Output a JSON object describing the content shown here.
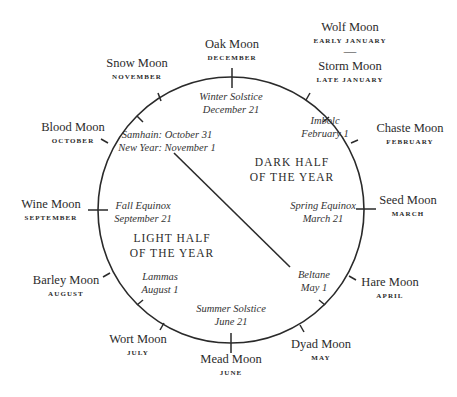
{
  "colors": {
    "ink": "#2a2a2a",
    "background": "#ffffff"
  },
  "geometry": {
    "cx": 231,
    "cy": 210,
    "r": 133
  },
  "divider": {
    "x1": 174,
    "y1": 153,
    "x2": 290,
    "y2": 267
  },
  "halves": {
    "dark": {
      "line1": "DARK HALF",
      "line2": "OF THE YEAR",
      "x": 292,
      "y": 166
    },
    "light": {
      "line1": "LIGHT HALF",
      "line2": "OF THE YEAR",
      "x": 172,
      "y": 242
    }
  },
  "moons": [
    {
      "name": "Oak Moon",
      "month": "DECEMBER",
      "x": 232,
      "y": 48
    },
    {
      "name": "Wolf Moon",
      "month": "EARLY JANUARY",
      "x": 350,
      "y": 31,
      "separator": "—"
    },
    {
      "name": "Storm Moon",
      "month": "LATE JANUARY",
      "x": 350,
      "y": 70
    },
    {
      "name": "Chaste Moon",
      "month": "FEBRUARY",
      "x": 410,
      "y": 132
    },
    {
      "name": "Seed Moon",
      "month": "MARCH",
      "x": 408,
      "y": 204
    },
    {
      "name": "Hare Moon",
      "month": "APRIL",
      "x": 390,
      "y": 286
    },
    {
      "name": "Dyad Moon",
      "month": "MAY",
      "x": 321,
      "y": 348
    },
    {
      "name": "Mead Moon",
      "month": "JUNE",
      "x": 231,
      "y": 363
    },
    {
      "name": "Wort Moon",
      "month": "JULY",
      "x": 138,
      "y": 343
    },
    {
      "name": "Barley Moon",
      "month": "AUGUST",
      "x": 66,
      "y": 284
    },
    {
      "name": "Wine Moon",
      "month": "SEPTEMBER",
      "x": 51,
      "y": 208
    },
    {
      "name": "Blood Moon",
      "month": "OCTOBER",
      "x": 73,
      "y": 131
    },
    {
      "name": "Snow Moon",
      "month": "NOVEMBER",
      "x": 137,
      "y": 67
    }
  ],
  "festivals": [
    {
      "line1": "Winter Solstice",
      "line2": "December 21",
      "x": 231,
      "y": 100
    },
    {
      "line1": "Imbolc",
      "line2": "February 1",
      "x": 325,
      "y": 124
    },
    {
      "line1": "Samhain: October 31",
      "line2": "New Year: November 1",
      "x": 167,
      "y": 138
    },
    {
      "line1": "Spring Equinox",
      "line2": "March 21",
      "x": 323,
      "y": 209
    },
    {
      "line1": "Fall Equinox",
      "line2": "September 21",
      "x": 143,
      "y": 209
    },
    {
      "line1": "Lammas",
      "line2": "August 1",
      "x": 160,
      "y": 280
    },
    {
      "line1": "Beltane",
      "line2": "May 1",
      "x": 314,
      "y": 278
    },
    {
      "line1": "Summer Solstice",
      "line2": "June 21",
      "x": 231,
      "y": 312
    }
  ],
  "ticks": {
    "crossing": [
      {
        "x1": 232,
        "y1": 68,
        "x2": 232,
        "y2": 88
      },
      {
        "x1": 231,
        "y1": 333,
        "x2": 231,
        "y2": 353
      },
      {
        "x1": 88,
        "y1": 210,
        "x2": 108,
        "y2": 210
      },
      {
        "x1": 356,
        "y1": 209,
        "x2": 376,
        "y2": 209
      }
    ],
    "outer": [
      {
        "x1": 161,
        "y1": 101,
        "x2": 158,
        "y2": 93
      },
      {
        "x1": 108,
        "y1": 143,
        "x2": 101,
        "y2": 139
      },
      {
        "x1": 306,
        "y1": 100,
        "x2": 310,
        "y2": 93
      },
      {
        "x1": 351,
        "y1": 143,
        "x2": 358,
        "y2": 140
      },
      {
        "x1": 349,
        "y1": 276,
        "x2": 356,
        "y2": 280
      },
      {
        "x1": 300,
        "y1": 325,
        "x2": 304,
        "y2": 332
      },
      {
        "x1": 164,
        "y1": 323,
        "x2": 160,
        "y2": 330
      },
      {
        "x1": 110,
        "y1": 273,
        "x2": 103,
        "y2": 277
      }
    ],
    "inner": [
      {
        "x1": 137,
        "y1": 116,
        "x2": 143,
        "y2": 122
      },
      {
        "x1": 329,
        "y1": 117,
        "x2": 323,
        "y2": 122
      },
      {
        "x1": 325,
        "y1": 305,
        "x2": 319,
        "y2": 300
      },
      {
        "x1": 137,
        "y1": 305,
        "x2": 143,
        "y2": 300
      }
    ]
  }
}
